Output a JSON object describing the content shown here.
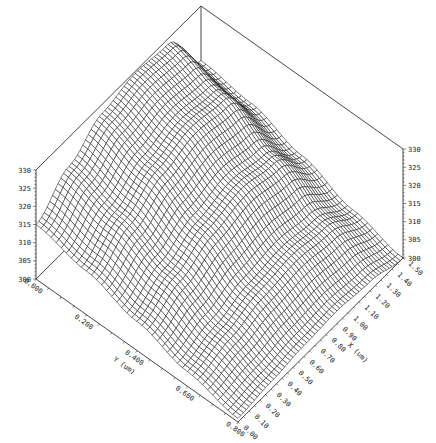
{
  "chart_data": {
    "type": "surface",
    "title": "",
    "xlabel": "X (um)",
    "ylabel": "Y (um)",
    "zlabel": "",
    "x_range": [
      0.0,
      1.5
    ],
    "y_range": [
      0.0,
      0.8
    ],
    "z_range": [
      300,
      330
    ],
    "x_ticks": [
      "0.00",
      "0.10",
      "0.20",
      "0.30",
      "0.40",
      "0.50",
      "0.60",
      "0.70",
      "0.80",
      "0.90",
      "1.00",
      "1.10",
      "1.20",
      "1.30",
      "1.40",
      "1.50"
    ],
    "y_ticks": [
      "0.000",
      "0.200",
      "0.400",
      "0.600",
      "0.800"
    ],
    "z_ticks": [
      "300",
      "305",
      "310",
      "315",
      "320",
      "325",
      "330"
    ],
    "grid": {
      "on": false
    },
    "mesh_resolution": [
      60,
      40
    ],
    "sample_x": [
      0.0,
      0.3,
      0.6,
      0.9,
      1.2,
      1.5
    ],
    "sample_y": [
      0.0,
      0.2,
      0.4,
      0.6,
      0.8
    ],
    "z_values": [
      [
        315.0,
        322.0,
        327.5,
        329.5,
        328.5,
        315.0
      ],
      [
        312.0,
        318.0,
        323.0,
        325.5,
        324.0,
        313.0
      ],
      [
        308.0,
        312.5,
        316.5,
        318.5,
        316.5,
        308.5
      ],
      [
        304.0,
        306.5,
        309.0,
        310.0,
        308.5,
        303.5
      ],
      [
        301.0,
        302.0,
        303.0,
        303.5,
        302.5,
        300.0
      ]
    ]
  }
}
